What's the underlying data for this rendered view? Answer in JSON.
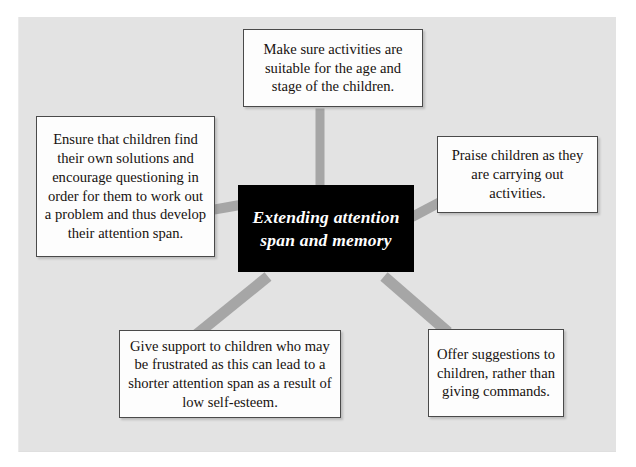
{
  "diagram": {
    "center": {
      "text": "Extending\nattention span\nand memory",
      "lines": [
        "Extending",
        "attention span",
        "and memory"
      ],
      "background_color": "#000000",
      "text_color": "#ffffff"
    },
    "nodes": [
      {
        "id": "top",
        "text": "Make sure activities are suitable for the age and stage of the children.",
        "lines": [
          "Make sure activities are",
          "suitable for the age and",
          "stage of the children."
        ]
      },
      {
        "id": "left",
        "text": "Ensure that children find their own solutions and encourage questioning in order for them to work out a problem and thus develop their attention span.",
        "lines": [
          "Ensure that children find",
          "their own solutions and",
          "encourage questioning",
          "in order for them to",
          "work out a problem and",
          "thus develop their",
          "attention span."
        ]
      },
      {
        "id": "right",
        "text": "Praise children as they are carrying out activities.",
        "lines": [
          "Praise children as they",
          "are carrying out",
          "activities."
        ]
      },
      {
        "id": "bottom-left",
        "text": "Give support to children who may be frustrated as this can lead to a shorter attention span as a result of low self-esteem.",
        "lines": [
          "Give support to children who",
          "may be frustrated as this can",
          "lead to a shorter attention span",
          "as a result of low self-esteem."
        ]
      },
      {
        "id": "bottom-right",
        "text": "Offer suggestions to children, rather than giving commands.",
        "lines": [
          "Offer suggestions",
          "to children, rather",
          "than giving",
          "commands."
        ]
      }
    ],
    "colors": {
      "panel_background": "#e3e3e3",
      "connector": "#a6a6a6",
      "node_background": "#fdfdfd",
      "node_border": "#4a4a4a",
      "text": "#17120f"
    }
  }
}
